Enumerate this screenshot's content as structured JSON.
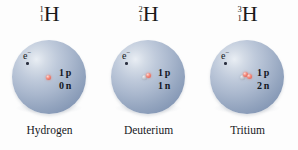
{
  "figure": {
    "background_color": "#fdfdfd",
    "sphere_color": "#a9b7cd",
    "proton_color": "#d9564a",
    "neutron_color": "#9aa3b0",
    "text_color": "#17191e"
  },
  "isotopes": [
    {
      "mass_number": "1",
      "atomic_number": "1",
      "element_symbol": "H",
      "electron_label": "e",
      "electron_charge": "−",
      "proton_count": "1",
      "proton_unit": "p",
      "neutron_count": "0",
      "neutron_unit": "n",
      "name": "Hydrogen",
      "protons": 1,
      "neutrons": 0
    },
    {
      "mass_number": "2",
      "atomic_number": "1",
      "element_symbol": "H",
      "electron_label": "e",
      "electron_charge": "−",
      "proton_count": "1",
      "proton_unit": "p",
      "neutron_count": "1",
      "neutron_unit": "n",
      "name": "Deuterium",
      "protons": 1,
      "neutrons": 1
    },
    {
      "mass_number": "3",
      "atomic_number": "1",
      "element_symbol": "H",
      "electron_label": "e",
      "electron_charge": "−",
      "proton_count": "1",
      "proton_unit": "p",
      "neutron_count": "2",
      "neutron_unit": "n",
      "name": "Tritium",
      "protons": 1,
      "neutrons": 2
    }
  ]
}
